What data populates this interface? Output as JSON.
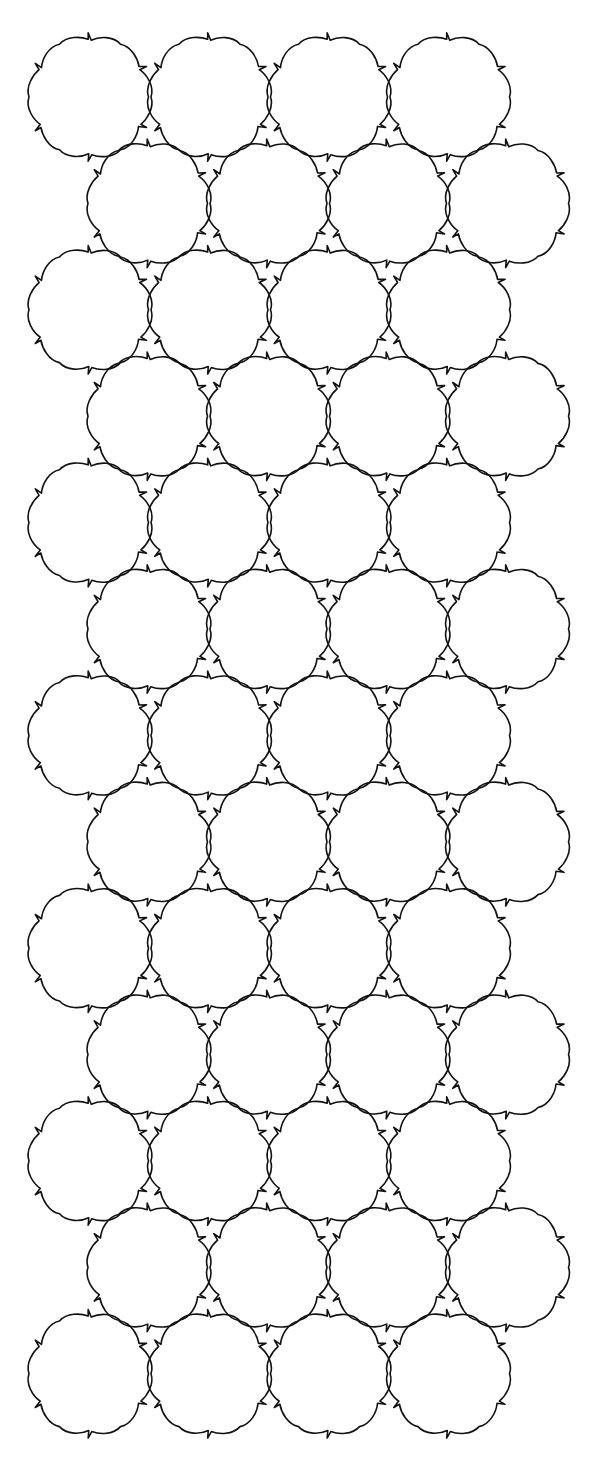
{
  "figure": {
    "background_color": "#ffffff",
    "stroke_color": "#111111",
    "stroke_width": 1.6
  },
  "grid": {
    "rows": 13,
    "tiles_per_row": 4,
    "first_row_center_y": 97,
    "row_step_y": 106.4,
    "odd_row_first_center_x": 90,
    "even_row_first_center_x": 149,
    "col_step_x": 119.5
  },
  "tile_shape": {
    "type": "notched-curved-hexagon",
    "radius": 61,
    "edge_bulge": 7,
    "notch_size": 5,
    "icon": "hexagon-notched"
  }
}
